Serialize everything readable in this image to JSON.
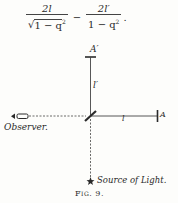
{
  "formula": {
    "term1_numerator": "2l",
    "term1_denominator": "√1 − q²",
    "term1_den_radical": "√",
    "term1_den_body": "1 − q",
    "term1_den_exp": "2",
    "operator": "−",
    "term2_numerator": "2l′",
    "term2_den_body": "1 − q",
    "term2_den_exp": "2",
    "terminator": "."
  },
  "diagram": {
    "mirror_top_label": "A′",
    "vertical_arm_label": "l′",
    "horizontal_arm_label": "l",
    "mirror_right_label": "A",
    "observer_label": "Observer.",
    "source_label": "Source of Light.",
    "caption": "Fig. 9.",
    "caption_prefix": "Fig.",
    "caption_number": "9.",
    "colors": {
      "ink": "#2a2a2a",
      "paper": "#fdfdfb"
    }
  }
}
